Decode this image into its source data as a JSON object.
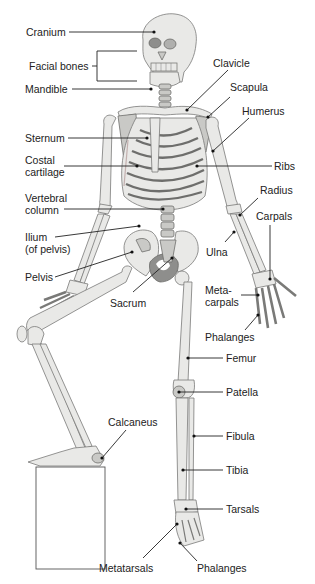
{
  "diagram": {
    "labels": {
      "cranium": "Cranium",
      "facial_bones": "Facial bones",
      "mandible": "Mandible",
      "clavicle": "Clavicle",
      "scapula": "Scapula",
      "humerus": "Humerus",
      "sternum": "Sternum",
      "costal_cartilage_1": "Costal",
      "costal_cartilage_2": "cartilage",
      "ribs": "Ribs",
      "vertebral_column_1": "Vertebral",
      "vertebral_column_2": "column",
      "radius": "Radius",
      "carpals": "Carpals",
      "ilium_1": "Ilium",
      "ilium_2": "(of pelvis)",
      "ulna": "Ulna",
      "pelvis": "Pelvis",
      "sacrum": "Sacrum",
      "metacarpals_1": "Meta-",
      "metacarpals_2": "carpals",
      "phalanges_hand": "Phalanges",
      "femur": "Femur",
      "patella": "Patella",
      "calcaneus": "Calcaneus",
      "fibula": "Fibula",
      "tibia": "Tibia",
      "tarsals": "Tarsals",
      "metatarsals": "Metatarsals",
      "phalanges_foot": "Phalanges"
    },
    "colors": {
      "bone_light": "#e9e9e7",
      "bone_mid": "#c9c9c6",
      "bone_dark": "#8e8e8c",
      "leader": "#222222",
      "text": "#222222"
    }
  }
}
